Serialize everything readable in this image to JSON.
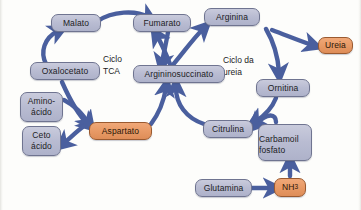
{
  "diagram": {
    "canvas": {
      "width": 361,
      "height": 210,
      "background": "#fdfdfb"
    },
    "colors": {
      "node_blue": "#b9bcd2",
      "node_orange": "#e89a66",
      "node_border": "#6f7490",
      "arrow": "#4a5f9e",
      "text": "#1c1c24"
    },
    "cycle_labels": [
      {
        "id": "tca",
        "line1": "Ciclo",
        "line2": "TCA"
      },
      {
        "id": "ureia",
        "line1": "Ciclo da",
        "line2": "ureia"
      }
    ],
    "nodes": [
      {
        "id": "malato",
        "label": "Malato",
        "color": "blue"
      },
      {
        "id": "fumarato",
        "label": "Fumarato",
        "color": "blue"
      },
      {
        "id": "arginina",
        "label": "Arginina",
        "color": "blue"
      },
      {
        "id": "ureia",
        "label": "Ureia",
        "color": "orange"
      },
      {
        "id": "oxalocetato",
        "label": "Oxalocetato",
        "color": "blue"
      },
      {
        "id": "argininosuccinato",
        "label": "Argininosuccinato",
        "color": "blue"
      },
      {
        "id": "ornitina",
        "label": "Ornitina",
        "color": "blue"
      },
      {
        "id": "aminoacido",
        "label_line1": "Amino-",
        "label_line2": "ácido",
        "color": "blue"
      },
      {
        "id": "cetoacido",
        "label_line1": "Ceto",
        "label_line2": "ácido",
        "color": "blue"
      },
      {
        "id": "aspartato",
        "label": "Aspartato",
        "color": "orange"
      },
      {
        "id": "citrulina",
        "label": "Citrulina",
        "color": "blue"
      },
      {
        "id": "carbamoilfosfato",
        "label_line1": "Carbamoil",
        "label_line2": "fosfato",
        "color": "blue"
      },
      {
        "id": "glutamina",
        "label": "Glutamina",
        "color": "blue"
      },
      {
        "id": "nh3",
        "label_main": "NH",
        "label_sub": "3",
        "color": "orange"
      }
    ],
    "edges": [
      {
        "from": "oxalocetato",
        "to": "malato"
      },
      {
        "from": "malato",
        "to": "fumarato"
      },
      {
        "from": "fumarato",
        "to": "argininosuccinato"
      },
      {
        "from": "argininosuccinato",
        "to": "fumarato"
      },
      {
        "from": "argininosuccinato",
        "to": "arginina"
      },
      {
        "from": "arginina",
        "to": "ureia"
      },
      {
        "from": "arginina",
        "to": "ornitina"
      },
      {
        "from": "ornitina",
        "to": "citrulina"
      },
      {
        "from": "citrulina",
        "to": "argininosuccinato"
      },
      {
        "from": "aspartato",
        "to": "argininosuccinato"
      },
      {
        "from": "oxalocetato",
        "to": "aspartato"
      },
      {
        "from": "aminoacido",
        "to": "aspartato"
      },
      {
        "from": "aspartato",
        "to": "cetoacido"
      },
      {
        "from": "carbamoilfosfato",
        "to": "citrulina"
      },
      {
        "from": "glutamina",
        "to": "nh3"
      },
      {
        "from": "nh3",
        "to": "carbamoilfosfato"
      }
    ]
  }
}
